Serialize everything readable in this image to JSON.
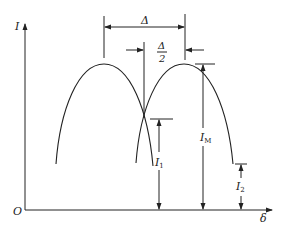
{
  "figure": {
    "type": "diagram",
    "axes": {
      "y_label": "I",
      "x_label": "δ",
      "origin_label": "O"
    },
    "dimensions": {
      "delta_label": "Δ",
      "half_delta_numerator": "Δ",
      "half_delta_denominator": "2"
    },
    "levels": {
      "i1_label": "I",
      "i1_sub": "1",
      "im_label": "I",
      "im_sub": "M",
      "i2_label": "I",
      "i2_sub": "2"
    },
    "curves": [
      {
        "name": "left-curve",
        "start": [
          56,
          164
        ],
        "peak": [
          104,
          64
        ],
        "end": [
          153,
          166
        ]
      },
      {
        "name": "right-curve",
        "start": [
          136,
          163
        ],
        "peak": [
          184,
          64
        ],
        "end": [
          233,
          164
        ]
      }
    ],
    "colors": {
      "stroke": "#222222",
      "background": "#ffffff"
    }
  }
}
